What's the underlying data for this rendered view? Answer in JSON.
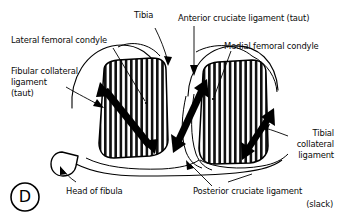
{
  "figure": {
    "panel_label": "D",
    "background_color": "#ffffff",
    "ink_color": "#000000"
  },
  "labels": {
    "tibia": "Tibia",
    "anterior_cruciate": "Anterior cruciate ligament (taut)",
    "lateral_femoral_condyle": "Lateral femoral condyle",
    "medial_femoral_condyle": "Medial femoral condyle",
    "fibular_collateral_line1": "Fibular collateral",
    "fibular_collateral_line2": "ligament",
    "fibular_collateral_line3": "(taut)",
    "tibial_collateral_line1": "Tibial",
    "tibial_collateral_line2": "collateral",
    "tibial_collateral_line3": "ligament",
    "head_of_fibula": "Head of fibula",
    "posterior_cruciate_line1": "Posterior cruciate ligament",
    "posterior_cruciate_line2": "(slack)"
  },
  "structures": [
    {
      "name": "lateral-tibial-plateau",
      "fill": "vertical-hatch"
    },
    {
      "name": "medial-tibial-plateau",
      "fill": "vertical-hatch"
    },
    {
      "name": "lateral-femoral-condyle-outline",
      "fill": "none"
    },
    {
      "name": "medial-femoral-condyle-outline",
      "fill": "none"
    },
    {
      "name": "head-of-fibula-outline",
      "fill": "none"
    },
    {
      "name": "tibial-shaft-outline",
      "fill": "none"
    },
    {
      "name": "posterior-cruciate-ligament-band",
      "fill": "none"
    }
  ],
  "arrows": [
    {
      "name": "fibular-collateral-ligament-arrow",
      "style": "double-headed-thick"
    },
    {
      "name": "anterior-cruciate-ligament-arrow",
      "style": "double-headed-thick"
    },
    {
      "name": "tibial-collateral-ligament-arrow",
      "style": "double-headed-thick"
    }
  ]
}
